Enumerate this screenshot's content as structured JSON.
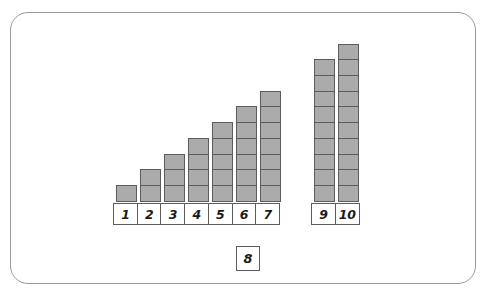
{
  "frame": {
    "border_color": "#9a9a9e",
    "background": "#ffffff",
    "corner_radius": "18px"
  },
  "palette": {
    "block_fill": "#ababab",
    "block_stroke": "#5c5c5c",
    "tile_fill": "#ffffff",
    "tile_stroke": "#5c5c5c",
    "text": "#1b1b1b"
  },
  "activity": {
    "missing_tile_label": "8",
    "missing_tile_value": 8
  },
  "chart_data": {
    "type": "bar",
    "title": "",
    "subtitle": "",
    "xlabel": "",
    "ylabel": "",
    "grid": false,
    "legend": null,
    "unit": "block",
    "ylim": [
      0,
      10
    ],
    "categories": [
      "1",
      "2",
      "3",
      "4",
      "5",
      "6",
      "7",
      "9",
      "10"
    ],
    "values": [
      1,
      2,
      3,
      4,
      5,
      6,
      7,
      9,
      10
    ],
    "missing_categories": [
      "8"
    ],
    "groups": [
      {
        "name": "left-group",
        "categories": [
          "1",
          "2",
          "3",
          "4",
          "5",
          "6",
          "7"
        ],
        "values": [
          1,
          2,
          3,
          4,
          5,
          6,
          7
        ]
      },
      {
        "name": "right-group",
        "categories": [
          "9",
          "10"
        ],
        "values": [
          9,
          10
        ]
      }
    ],
    "annotations": [
      {
        "text": "8",
        "role": "detached-tile",
        "position": "below-center"
      }
    ]
  },
  "columns": [
    {
      "label": "1",
      "blocks": 1,
      "group": "left",
      "x": 116
    },
    {
      "label": "2",
      "blocks": 2,
      "group": "left",
      "x": 140
    },
    {
      "label": "3",
      "blocks": 3,
      "group": "left",
      "x": 164
    },
    {
      "label": "4",
      "blocks": 4,
      "group": "left",
      "x": 188
    },
    {
      "label": "5",
      "blocks": 5,
      "group": "left",
      "x": 212
    },
    {
      "label": "6",
      "blocks": 6,
      "group": "left",
      "x": 236
    },
    {
      "label": "7",
      "blocks": 7,
      "group": "left",
      "x": 260
    },
    {
      "label": "9",
      "blocks": 9,
      "group": "right",
      "x": 314
    },
    {
      "label": "10",
      "blocks": 10,
      "group": "right",
      "x": 338
    }
  ],
  "label_rows": [
    {
      "name": "left",
      "x": 113,
      "labels": [
        "1",
        "2",
        "3",
        "4",
        "5",
        "6",
        "7"
      ]
    },
    {
      "name": "right",
      "x": 311,
      "labels": [
        "9",
        "10"
      ]
    }
  ]
}
